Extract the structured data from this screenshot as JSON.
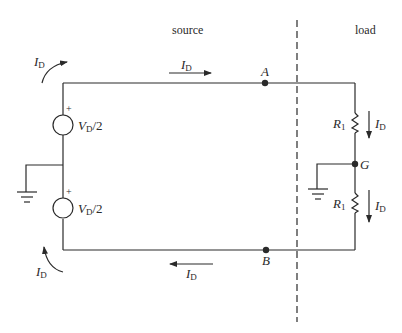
{
  "diagram": {
    "type": "circuit-schematic",
    "regions": {
      "source_label": "source",
      "load_label": "load"
    },
    "nodes": {
      "A": "A",
      "B": "B",
      "G": "G"
    },
    "sources": [
      {
        "id": "top-source",
        "label_main": "V",
        "label_sub": "D",
        "label_suffix": "/2",
        "polarity": "+"
      },
      {
        "id": "bottom-source",
        "label_main": "V",
        "label_sub": "D",
        "label_suffix": "/2",
        "polarity": "+"
      }
    ],
    "resistors": [
      {
        "id": "top-resistor",
        "label_main": "R",
        "label_sub": "1"
      },
      {
        "id": "bottom-resistor",
        "label_main": "R",
        "label_sub": "1"
      }
    ],
    "currents": [
      {
        "id": "current-top-left",
        "label_main": "I",
        "label_sub": "D",
        "direction": "curved-up-right"
      },
      {
        "id": "current-top-wire",
        "label_main": "I",
        "label_sub": "D",
        "direction": "right"
      },
      {
        "id": "current-top-resistor",
        "label_main": "I",
        "label_sub": "D",
        "direction": "down"
      },
      {
        "id": "current-bottom-resistor",
        "label_main": "I",
        "label_sub": "D",
        "direction": "down"
      },
      {
        "id": "current-bottom-wire",
        "label_main": "I",
        "label_sub": "D",
        "direction": "left"
      },
      {
        "id": "current-bottom-left",
        "label_main": "I",
        "label_sub": "D",
        "direction": "curved-up"
      }
    ],
    "grounds": [
      "source-ground",
      "load-ground"
    ],
    "colors": {
      "line": "#2a2a2a",
      "background": "#ffffff"
    }
  }
}
